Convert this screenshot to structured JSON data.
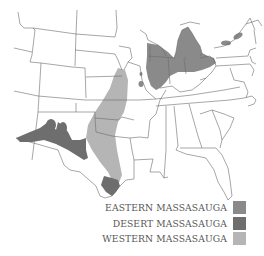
{
  "map": {
    "title": "Massasauga range map",
    "colors": {
      "eastern": "#8a8a8a",
      "desert": "#6e6e6e",
      "western": "#b5b5b5",
      "border": "#6b6b6b"
    }
  },
  "legend": {
    "items": [
      {
        "label": "EASTERN MASSASAUGA",
        "color": "#8a8a8a"
      },
      {
        "label": "DESERT MASSASAUGA",
        "color": "#6e6e6e"
      },
      {
        "label": "WESTERN MASSASAUGA",
        "color": "#b5b5b5"
      }
    ]
  }
}
